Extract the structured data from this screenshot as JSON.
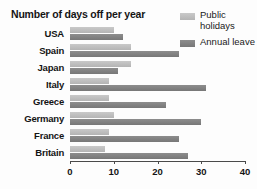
{
  "chart_data": {
    "type": "bar",
    "orientation": "horizontal",
    "title": "Number of days off per year",
    "xlabel": "",
    "ylabel": "",
    "categories": [
      "USA",
      "Spain",
      "Japan",
      "Italy",
      "Greece",
      "Germany",
      "France",
      "Britain"
    ],
    "series": [
      {
        "name": "Public holidays",
        "color": "#c0c0c0",
        "values": [
          10,
          14,
          14,
          9,
          9,
          10,
          9,
          8
        ]
      },
      {
        "name": "Annual leave",
        "color": "#828282",
        "values": [
          12,
          25,
          11,
          31,
          22,
          30,
          25,
          27
        ]
      }
    ],
    "xticks": [
      0,
      10,
      20,
      30,
      40
    ],
    "xtick_labels": [
      "0",
      "10",
      "20",
      "30",
      "40"
    ],
    "xlim": [
      0,
      40
    ],
    "grid": false,
    "legend_position": "top-right"
  },
  "legend": {
    "items": [
      {
        "label": "Public holidays",
        "color": "#c0c0c0"
      },
      {
        "label": "Annual leave",
        "color": "#828282"
      }
    ]
  }
}
